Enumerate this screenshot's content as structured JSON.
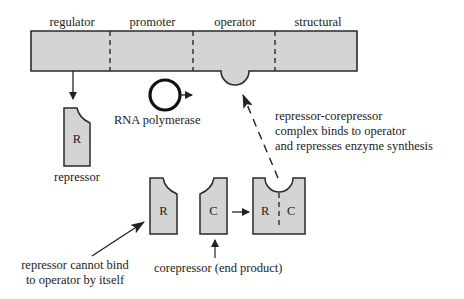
{
  "diagram": {
    "gene_segments": [
      "regulator",
      "promoter",
      "operator",
      "structural"
    ],
    "rna_polymerase_label": "RNA polymerase",
    "repressor": {
      "symbol": "R",
      "label": "repressor"
    },
    "corepressor": {
      "symbol": "C",
      "label": "corepressor (end product)"
    },
    "complex": {
      "left": "R",
      "right": "C"
    },
    "annotations": {
      "cannot_bind_line1": "repressor cannot bind",
      "cannot_bind_line2": "to operator by itself",
      "complex_line1": "repressor-corepressor",
      "complex_line2": "complex binds to operator",
      "complex_line3": "and represses enzyme synthesis"
    },
    "colors": {
      "fill": "#d4d4d4",
      "stroke": "#2a2a2a"
    }
  }
}
